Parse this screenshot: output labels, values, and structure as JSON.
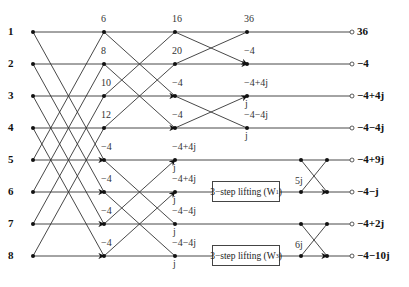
{
  "figure": {
    "type": "8-point FFT signal flow graph with lifting",
    "inputs": [
      "1",
      "2",
      "3",
      "4",
      "5",
      "6",
      "7",
      "8"
    ],
    "stage1_values": [
      "6",
      "8",
      "10",
      "12",
      "−4",
      "−4",
      "−4",
      "−4"
    ],
    "stage2_values": [
      "16",
      "20",
      "−4",
      "−4",
      "−4+4j",
      "−4+4j",
      "−4−4j",
      "−4−4j"
    ],
    "stage2_twiddles": [
      "",
      "",
      "",
      "",
      "j",
      "j",
      "j",
      "j"
    ],
    "stage3_values": [
      "36",
      "−4",
      "−4+4j",
      "−4−4j"
    ],
    "stage3_twiddles": [
      "",
      "",
      "j",
      "j"
    ],
    "lifting_blocks": [
      {
        "label": "3−step lifting (W",
        "superscript": "1",
        "close": ")"
      },
      {
        "label": "3−step lifting (W",
        "superscript": "3",
        "close": ")"
      }
    ],
    "lifting_multipliers": [
      "5j",
      "6j"
    ],
    "outputs": [
      "36",
      "−4",
      "−4+4j",
      "−4−4j",
      "−4+9j",
      "−4−j",
      "−4+2j",
      "−4−10j"
    ],
    "colors": {
      "line": "#333333",
      "node": "#111111",
      "background": "#ffffff"
    }
  }
}
